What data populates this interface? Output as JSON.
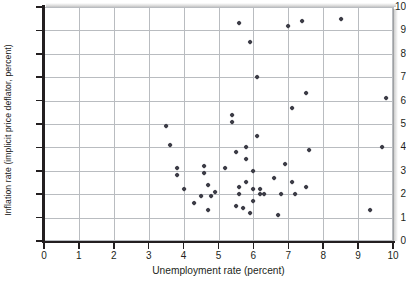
{
  "chart_data": {
    "type": "scatter",
    "title": "",
    "xlabel": "Unemployment rate (percent)",
    "ylabel": "Inflation rate (implicit price deflator, percent)",
    "xlim": [
      0,
      10
    ],
    "ylim": [
      0,
      10
    ],
    "xticks": [
      "0",
      "1",
      "2",
      "3",
      "4",
      "5",
      "6",
      "7",
      "8",
      "9",
      "10"
    ],
    "yticks": [
      "0",
      "1",
      "2",
      "3",
      "4",
      "5",
      "6",
      "7",
      "8",
      "9",
      "10"
    ],
    "grid": true,
    "legend": null,
    "marker": "diamond",
    "marker_color": "#3c3c46",
    "grid_color": "#b9bcc0",
    "axis_color": "#231f20",
    "series": [
      {
        "name": "Annual observations",
        "points": [
          [
            3.5,
            4.9
          ],
          [
            3.6,
            4.1
          ],
          [
            3.8,
            3.1
          ],
          [
            3.8,
            2.8
          ],
          [
            4.0,
            2.2
          ],
          [
            4.3,
            1.6
          ],
          [
            4.5,
            1.9
          ],
          [
            4.6,
            3.2
          ],
          [
            4.6,
            2.9
          ],
          [
            4.7,
            2.4
          ],
          [
            4.7,
            1.3
          ],
          [
            4.8,
            1.9
          ],
          [
            4.9,
            2.1
          ],
          [
            5.2,
            3.1
          ],
          [
            5.4,
            5.4
          ],
          [
            5.4,
            5.1
          ],
          [
            5.5,
            3.8
          ],
          [
            5.5,
            1.5
          ],
          [
            5.6,
            2.3
          ],
          [
            5.6,
            2.0
          ],
          [
            5.6,
            9.3
          ],
          [
            5.7,
            1.4
          ],
          [
            5.8,
            3.5
          ],
          [
            5.8,
            4.0
          ],
          [
            5.8,
            2.5
          ],
          [
            5.9,
            1.2
          ],
          [
            5.9,
            8.5
          ],
          [
            6.0,
            3.0
          ],
          [
            6.0,
            1.7
          ],
          [
            6.0,
            2.2
          ],
          [
            6.1,
            7.0
          ],
          [
            6.1,
            4.5
          ],
          [
            6.2,
            2.2
          ],
          [
            6.2,
            2.0
          ],
          [
            6.3,
            2.0
          ],
          [
            6.6,
            2.7
          ],
          [
            6.7,
            1.1
          ],
          [
            6.8,
            2.0
          ],
          [
            6.9,
            3.3
          ],
          [
            7.0,
            9.2
          ],
          [
            7.1,
            2.5
          ],
          [
            7.1,
            5.7
          ],
          [
            7.2,
            2.0
          ],
          [
            7.4,
            9.4
          ],
          [
            7.5,
            2.3
          ],
          [
            7.5,
            6.3
          ],
          [
            7.6,
            3.9
          ],
          [
            8.5,
            9.5
          ],
          [
            9.35,
            1.3
          ],
          [
            9.7,
            4.0
          ],
          [
            9.8,
            6.1
          ]
        ]
      }
    ]
  }
}
